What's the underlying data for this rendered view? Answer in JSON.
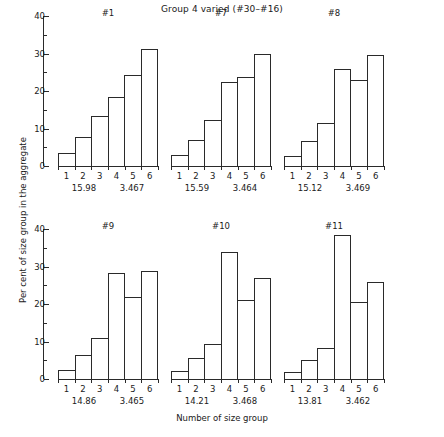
{
  "chart_data": {
    "type": "bar",
    "title": "Group 4 varied (#30–#16)",
    "xlabel": "Number of size group",
    "ylabel": "Per cent of size group in the aggregate",
    "categories": [
      "1",
      "2",
      "3",
      "4",
      "5",
      "6"
    ],
    "ylim": [
      0,
      40
    ],
    "yticks": [
      0,
      10,
      20,
      30,
      40
    ],
    "ytick_labels": [
      "0",
      "10",
      "20",
      "30",
      "40"
    ],
    "yminor_ticks": [
      5,
      15,
      25,
      35
    ],
    "grid": false,
    "legend": "none",
    "layout": {
      "rows": 2,
      "cols": 3
    },
    "panels": [
      {
        "name": "#1",
        "values": [
          3.5,
          7.8,
          13.3,
          18.3,
          24.2,
          31.2
        ],
        "annotation_left": "15.98",
        "annotation_right": "3.467"
      },
      {
        "name": "#7",
        "values": [
          3.0,
          7.0,
          12.2,
          22.3,
          23.8,
          30.0
        ],
        "annotation_left": "15.59",
        "annotation_right": "3.464"
      },
      {
        "name": "#8",
        "values": [
          2.7,
          6.6,
          11.6,
          26.0,
          22.9,
          29.5
        ],
        "annotation_left": "15.12",
        "annotation_right": "3.469"
      },
      {
        "name": "#9",
        "values": [
          2.5,
          6.3,
          11.0,
          28.2,
          22.0,
          28.7
        ],
        "annotation_left": "14.86",
        "annotation_right": "3.465"
      },
      {
        "name": "#10",
        "values": [
          2.2,
          5.7,
          9.4,
          34.0,
          21.0,
          27.0
        ],
        "annotation_left": "14.21",
        "annotation_right": "3.468"
      },
      {
        "name": "#11",
        "values": [
          2.0,
          5.0,
          8.2,
          38.5,
          20.5,
          26.0
        ],
        "annotation_left": "13.81",
        "annotation_right": "3.462"
      }
    ]
  }
}
